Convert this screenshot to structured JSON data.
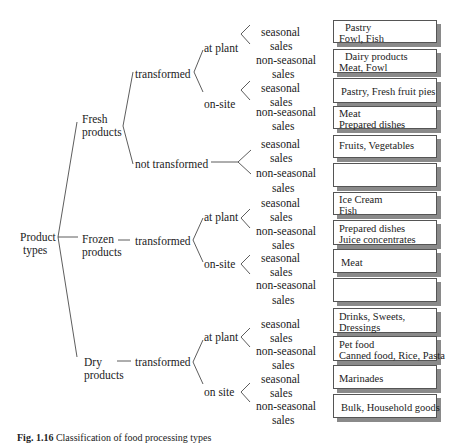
{
  "root": {
    "line1": "Product",
    "line2": "types"
  },
  "categories": [
    {
      "line1": "Fresh",
      "line2": "products"
    },
    {
      "line1": "Frozen",
      "line2": "products"
    },
    {
      "line1": "Dry",
      "line2": "products"
    }
  ],
  "processing": {
    "fresh_transformed": "transformed",
    "fresh_not_transformed": "not transformed",
    "frozen_transformed": "transformed",
    "dry_transformed": "transformed"
  },
  "locations": {
    "fresh_at_plant": "at plant",
    "fresh_on_site": "on-site",
    "frozen_at_plant": "at plant",
    "frozen_on_site": "on-site",
    "dry_at_plant": "at plant",
    "dry_on_site": "on site"
  },
  "sales": {
    "seasonal_1": "seasonal",
    "nonseasonal_1": "non-seasonal",
    "sales_2": "sales"
  },
  "boxes": [
    {
      "line1": "Pastry",
      "line2": "Fowl, Fish"
    },
    {
      "line1": "Dairy products",
      "line2": "Meat, Fowl"
    },
    {
      "line1": "Pastry, Fresh fruit pies",
      "line2": ""
    },
    {
      "line1": "Meat",
      "line2": "Prepared dishes"
    },
    {
      "line1": "Fruits, Vegetables",
      "line2": ""
    },
    {
      "line1": "",
      "line2": ""
    },
    {
      "line1": "Ice Cream",
      "line2": "Fish"
    },
    {
      "line1": "Prepared dishes",
      "line2": "Juice concentrates"
    },
    {
      "line1": "Meat",
      "line2": ""
    },
    {
      "line1": "",
      "line2": ""
    },
    {
      "line1": "Drinks, Sweets,",
      "line2": "Dressings"
    },
    {
      "line1": "Pet food",
      "line2": "Canned food, Rice, Pasta"
    },
    {
      "line1": "Marinades",
      "line2": ""
    },
    {
      "line1": "Bulk, Household goods",
      "line2": ""
    }
  ],
  "caption": {
    "label": "Fig. 1.16",
    "text": "Classification of food processing types"
  }
}
